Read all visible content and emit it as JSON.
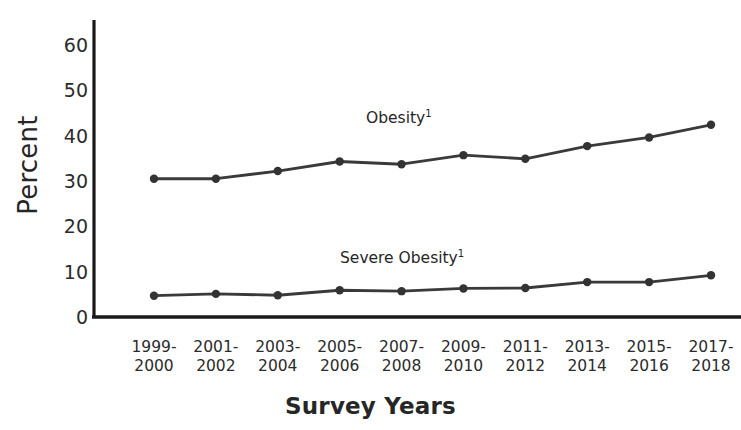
{
  "chart_data": {
    "type": "line",
    "title": "",
    "xlabel": "Survey Years",
    "ylabel": "Percent",
    "ylim": [
      0,
      65
    ],
    "yticks": [
      0,
      10,
      20,
      30,
      40,
      50,
      60
    ],
    "grid": false,
    "legend_position": "inline-labels",
    "categories": [
      "1999-\n2000",
      "2001-\n2002",
      "2003-\n2004",
      "2005-\n2006",
      "2007-\n2008",
      "2009-\n2010",
      "2011-\n2012",
      "2013-\n2014",
      "2015-\n2016",
      "2017-\n2018"
    ],
    "category_lines": [
      [
        "1999-",
        "2000"
      ],
      [
        "2001-",
        "2002"
      ],
      [
        "2003-",
        "2004"
      ],
      [
        "2005-",
        "2006"
      ],
      [
        "2007-",
        "2008"
      ],
      [
        "2009-",
        "2010"
      ],
      [
        "2011-",
        "2012"
      ],
      [
        "2013-",
        "2014"
      ],
      [
        "2015-",
        "2016"
      ],
      [
        "2017-",
        "2018"
      ]
    ],
    "series": [
      {
        "name": "Obesity",
        "footnote": "1",
        "label_text": "Obesity",
        "color": "#3a3a3a",
        "values": [
          30.5,
          30.5,
          32.2,
          34.3,
          33.7,
          35.7,
          34.9,
          37.7,
          39.6,
          42.4
        ]
      },
      {
        "name": "Severe Obesity",
        "footnote": "1",
        "label_text": "Severe Obesity",
        "color": "#3a3a3a",
        "values": [
          4.7,
          5.1,
          4.8,
          5.9,
          5.7,
          6.3,
          6.4,
          7.7,
          7.7,
          9.2
        ]
      }
    ]
  },
  "axis": {
    "y_title": "Percent",
    "x_title": "Survey Years",
    "tick_labels_y": [
      "60",
      "50",
      "40",
      "30",
      "20",
      "10",
      "0"
    ]
  },
  "annotations": {
    "obesity_label": "Obesity",
    "obesity_footnote": "1",
    "severe_obesity_label": "Severe Obesity",
    "severe_obesity_footnote": "1"
  },
  "colors": {
    "line": "#3a3a3a",
    "marker": "#333333",
    "axis": "#1a1a1a",
    "text": "#2b2b2b"
  }
}
